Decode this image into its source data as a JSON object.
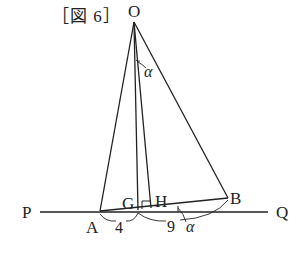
{
  "figure": {
    "caption": "［図 6］"
  },
  "labels": {
    "O": "O",
    "P": "P",
    "Q": "Q",
    "A": "A",
    "G": "G",
    "H": "H",
    "B": "B",
    "len_AG": "4",
    "len_GB": "9",
    "angle_top": "α",
    "angle_bottom": "α"
  },
  "colors": {
    "stroke": "#222222",
    "background": "#ffffff"
  },
  "points": {
    "O": [
      134,
      22
    ],
    "A": [
      100,
      211
    ],
    "G": [
      138,
      210
    ],
    "H": [
      151,
      208
    ],
    "B": [
      228,
      198
    ],
    "P_line_start": [
      40,
      212
    ],
    "Q_line_end": [
      268,
      212
    ]
  }
}
